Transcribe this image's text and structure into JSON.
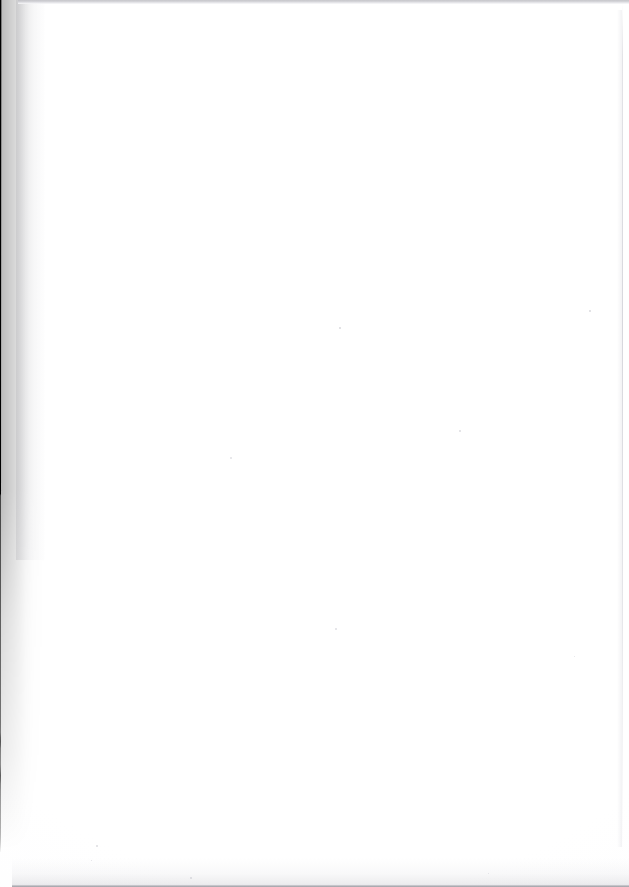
{
  "document": {
    "kind": "scanned-page",
    "page_content": "",
    "page_text": "",
    "note": "blank page",
    "width_px": 629,
    "height_px": 887
  },
  "surface": {
    "paper_color": "#ffffff",
    "paper_tint": "#fbfbfc"
  },
  "artifacts": {
    "gutter": {
      "name": "binding-gutter-shadow",
      "color": "#000000",
      "edge": "left",
      "top_width_px": 21,
      "mid_width_px": 16,
      "lower_width_px": 8,
      "fade_out_y_px": 845
    },
    "top_edge": {
      "name": "scan-edge-top",
      "color": "#bfbfc4",
      "height_px": 4
    },
    "bottom_edge": {
      "name": "scan-edge-bottom",
      "color": "#8e8e95",
      "height_px": 3
    },
    "right_edge": {
      "name": "page-edge-right",
      "color": "#c6c6ce",
      "x_px": 622
    },
    "specks": [
      {
        "x": 339,
        "y": 327,
        "size": 2,
        "color": "#d8d8dd"
      },
      {
        "x": 459,
        "y": 430,
        "size": 2,
        "color": "#dcdce1"
      },
      {
        "x": 230,
        "y": 457,
        "size": 2,
        "color": "#e0e0e4"
      },
      {
        "x": 589,
        "y": 310,
        "size": 2,
        "color": "#dadade"
      },
      {
        "x": 335,
        "y": 628,
        "size": 2,
        "color": "#dedee3"
      },
      {
        "x": 574,
        "y": 656,
        "size": 1,
        "color": "#e2e2e6"
      },
      {
        "x": 96,
        "y": 845,
        "size": 2,
        "color": "#dcdce1"
      },
      {
        "x": 190,
        "y": 877,
        "size": 2,
        "color": "#d6d6db"
      },
      {
        "x": 488,
        "y": 873,
        "size": 1,
        "color": "#dedee3"
      },
      {
        "x": 91,
        "y": 860,
        "size": 1,
        "color": "#e0e0e5"
      }
    ]
  }
}
